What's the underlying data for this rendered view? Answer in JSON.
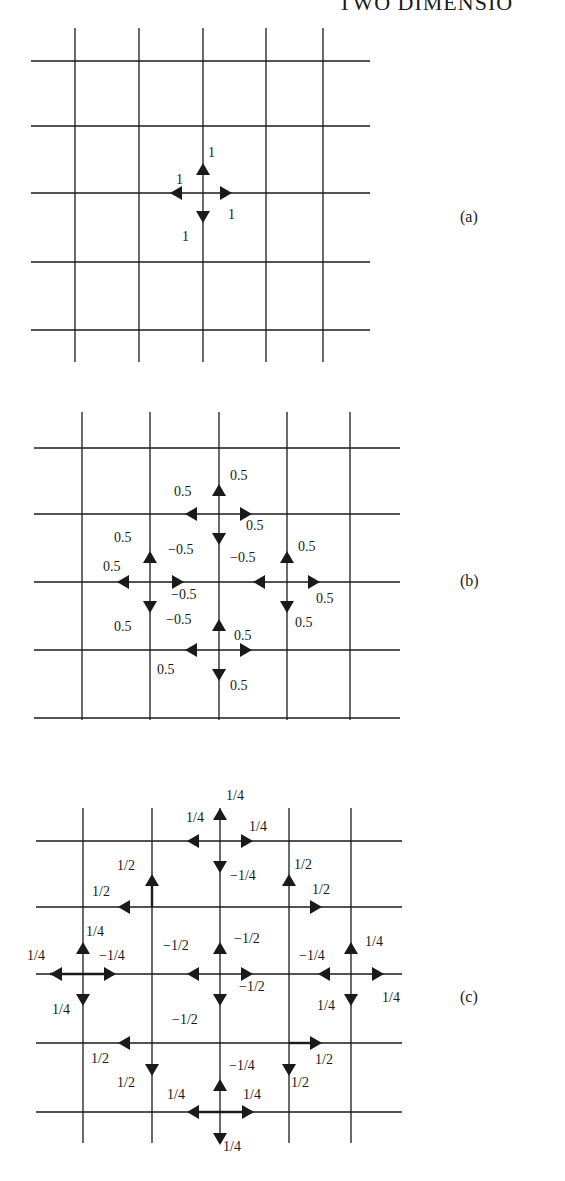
{
  "header": {
    "title": "TWO DIMENSIO"
  },
  "colors": {
    "ink": "#1a1a1a",
    "background": "#ffffff"
  },
  "panels": [
    {
      "id": "a",
      "label": "(a)",
      "grid": {
        "x": [
          75,
          139,
          203,
          266,
          323
        ],
        "y": [
          61,
          126,
          193,
          262,
          330
        ],
        "x_span": [
          31,
          370
        ],
        "y_span": [
          28,
          362
        ]
      },
      "center": [
        203,
        193
      ],
      "arrows": [
        {
          "node": [
            203,
            193
          ],
          "dir": "up",
          "value": "1"
        },
        {
          "node": [
            203,
            193
          ],
          "dir": "left",
          "value": "1"
        },
        {
          "node": [
            203,
            193
          ],
          "dir": "right",
          "value": "1"
        },
        {
          "node": [
            203,
            193
          ],
          "dir": "down",
          "value": "1"
        }
      ],
      "labels": [
        {
          "text": "1",
          "x": 208,
          "y": 156
        },
        {
          "text": "1",
          "x": 175,
          "y": 183
        },
        {
          "text": "1",
          "x": 228,
          "y": 218
        },
        {
          "text": "1",
          "x": 182,
          "y": 240
        }
      ]
    },
    {
      "id": "b",
      "label": "(b)",
      "grid": {
        "x": [
          82,
          150,
          219,
          287,
          350
        ],
        "y": [
          448,
          514,
          582,
          650,
          718
        ],
        "x_span": [
          34,
          400
        ],
        "y_span": [
          412,
          720
        ]
      },
      "labels": [
        {
          "text": "0.5",
          "x": 230,
          "y": 480
        },
        {
          "text": "0.5",
          "x": 174,
          "y": 496
        },
        {
          "text": "0.5",
          "x": 246,
          "y": 529
        },
        {
          "text": "0.5",
          "x": 114,
          "y": 542
        },
        {
          "text": "−0.5",
          "x": 168,
          "y": 553
        },
        {
          "text": "−0.5",
          "x": 230,
          "y": 561
        },
        {
          "text": "0.5",
          "x": 298,
          "y": 550
        },
        {
          "text": "0.5",
          "x": 103,
          "y": 570
        },
        {
          "text": "−0.5",
          "x": 171,
          "y": 598
        },
        {
          "text": "0.5",
          "x": 316,
          "y": 603
        },
        {
          "text": "0.5",
          "x": 115,
          "y": 630
        },
        {
          "text": "−0.5",
          "x": 166,
          "y": 624
        },
        {
          "text": "0.5",
          "x": 295,
          "y": 627
        },
        {
          "text": "0.5",
          "x": 234,
          "y": 640
        },
        {
          "text": "0.5",
          "x": 157,
          "y": 674
        },
        {
          "text": "0.5",
          "x": 230,
          "y": 690
        }
      ]
    },
    {
      "id": "c",
      "label": "(c)",
      "grid": {
        "x": [
          83,
          152,
          220,
          289,
          351
        ],
        "y": [
          841,
          907,
          974,
          1043,
          1112
        ],
        "x_span": [
          36,
          402
        ],
        "y_span": [
          808,
          1143
        ]
      },
      "labels": [
        {
          "text": "1/4",
          "x": 226,
          "y": 800
        },
        {
          "text": "1/4",
          "x": 186,
          "y": 822
        },
        {
          "text": "1/4",
          "x": 249,
          "y": 831
        },
        {
          "text": "1/2",
          "x": 117,
          "y": 870
        },
        {
          "text": "−1/4",
          "x": 230,
          "y": 880
        },
        {
          "text": "1/2",
          "x": 294,
          "y": 869
        },
        {
          "text": "1/2",
          "x": 92,
          "y": 896
        },
        {
          "text": "1/2",
          "x": 312,
          "y": 894
        },
        {
          "text": "1/4",
          "x": 86,
          "y": 936
        },
        {
          "text": "−1/2",
          "x": 163,
          "y": 950
        },
        {
          "text": "−1/2",
          "x": 234,
          "y": 943
        },
        {
          "text": "1/4",
          "x": 365,
          "y": 946
        },
        {
          "text": "1/4",
          "x": 27,
          "y": 960
        },
        {
          "text": "−1/4",
          "x": 99,
          "y": 960
        },
        {
          "text": "−1/4",
          "x": 299,
          "y": 960
        },
        {
          "text": "−1/2",
          "x": 239,
          "y": 991
        },
        {
          "text": "1/4",
          "x": 382,
          "y": 1002
        },
        {
          "text": "1/4",
          "x": 52,
          "y": 1014
        },
        {
          "text": "1/4",
          "x": 317,
          "y": 1010
        },
        {
          "text": "−1/2",
          "x": 172,
          "y": 1024
        },
        {
          "text": "1/2",
          "x": 91,
          "y": 1063
        },
        {
          "text": "1/2",
          "x": 315,
          "y": 1064
        },
        {
          "text": "−1/4",
          "x": 229,
          "y": 1070
        },
        {
          "text": "1/2",
          "x": 117,
          "y": 1087
        },
        {
          "text": "1/2",
          "x": 291,
          "y": 1087
        },
        {
          "text": "1/4",
          "x": 167,
          "y": 1099
        },
        {
          "text": "1/4",
          "x": 243,
          "y": 1099
        },
        {
          "text": "1/4",
          "x": 223,
          "y": 1150
        }
      ]
    }
  ]
}
